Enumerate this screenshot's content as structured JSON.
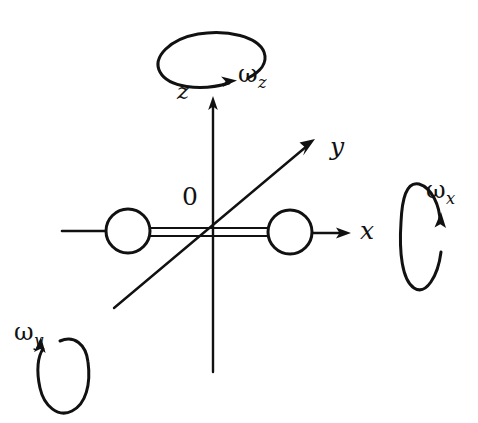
{
  "figure": {
    "background_color": "#ffffff",
    "ink_color": "#111111",
    "width": 478,
    "height": 423
  },
  "axes": [
    {
      "id": "x",
      "label": "x",
      "label_text": "x",
      "direction": "right",
      "origin": [
        213,
        233
      ],
      "tip": [
        350,
        233
      ]
    },
    {
      "id": "y",
      "label": "y",
      "label_text": "y",
      "direction": "up-right-diagonal",
      "origin": [
        213,
        233
      ],
      "tip": [
        313,
        140
      ],
      "tail": [
        114,
        308
      ]
    },
    {
      "id": "z",
      "label": "z",
      "label_text": "z",
      "direction": "up",
      "origin": [
        213,
        233
      ],
      "tip": [
        213,
        98
      ],
      "tail": [
        213,
        372
      ]
    }
  ],
  "origin_label": "0",
  "angular_velocities": [
    {
      "id": "omega-x",
      "symbol": "ω",
      "subscript": "x",
      "label_text": "ωx",
      "loop_orientation": "vertical",
      "loop_center": [
        425,
        237
      ],
      "arrow_direction": "up"
    },
    {
      "id": "omega-y",
      "symbol": "ω",
      "subscript": "y",
      "label_text": "ωy",
      "loop_orientation": "vertical",
      "loop_center": [
        58,
        372
      ],
      "arrow_direction": "up"
    },
    {
      "id": "omega-z",
      "symbol": "ω",
      "subscript": "z",
      "label_text": "ωz",
      "loop_orientation": "horizontal",
      "loop_center": [
        205,
        58
      ],
      "arrow_direction": "right"
    }
  ],
  "body": {
    "name": "dumbbell",
    "left_ball": {
      "center": [
        128,
        231
      ],
      "radius": 22
    },
    "right_ball": {
      "center": [
        290,
        232
      ],
      "radius": 22
    },
    "rod": {
      "from": [
        150,
        232
      ],
      "to": [
        268,
        232
      ]
    },
    "left_stub": {
      "from": [
        62,
        231
      ],
      "to": [
        106,
        231
      ]
    }
  }
}
